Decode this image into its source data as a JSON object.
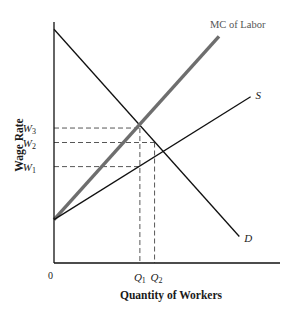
{
  "diagram": {
    "type": "labor-market-monopsony",
    "axes": {
      "xlabel": "Quantity of Workers",
      "ylabel": "Wage Rate",
      "origin_label": "0"
    },
    "wage_levels": [
      {
        "symbol": "W",
        "sub": "3",
        "value": 0.56
      },
      {
        "symbol": "W",
        "sub": "2",
        "value": 0.5
      },
      {
        "symbol": "W",
        "sub": "1",
        "value": 0.4
      }
    ],
    "quantity_levels": [
      {
        "symbol": "Q",
        "sub": "1",
        "value": 0.38
      },
      {
        "symbol": "Q",
        "sub": "2",
        "value": 0.445
      }
    ],
    "curves": [
      {
        "id": "demand",
        "label": "D",
        "color": "#111111",
        "points": [
          [
            0,
            0.97
          ],
          [
            0.82,
            0.11
          ]
        ]
      },
      {
        "id": "mc-of-labor",
        "label": "MC of Labor",
        "color": "#6e6e6e",
        "points": [
          [
            0,
            0.18
          ],
          [
            0.73,
            0.94
          ]
        ]
      },
      {
        "id": "supply",
        "label": "S",
        "color": "#111111",
        "points": [
          [
            0,
            0.18
          ],
          [
            0.87,
            0.69
          ]
        ]
      }
    ],
    "colors": {
      "axis": "#111111",
      "dashed": "#444444",
      "mc_line": "#6e6e6e"
    }
  }
}
